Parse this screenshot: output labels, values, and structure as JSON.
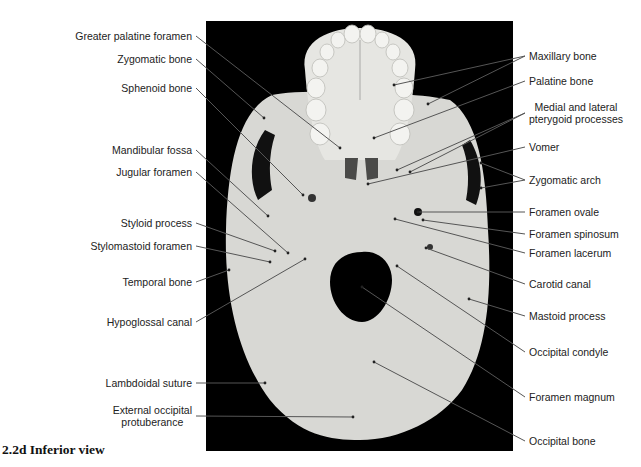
{
  "figure": {
    "caption": "2.2d Inferior view",
    "colors": {
      "background": "#000000",
      "bone": "#d9d9d6",
      "leader": "#555555",
      "label_text": "#222222"
    }
  },
  "labels_left": [
    {
      "id": "greater-palatine-foramen",
      "text": "Greater palatine foramen",
      "x": 196,
      "y": 36,
      "tx": 340,
      "ty": 148
    },
    {
      "id": "zygomatic-bone",
      "text": "Zygomatic bone",
      "x": 196,
      "y": 59,
      "tx": 264,
      "ty": 118
    },
    {
      "id": "sphenoid-bone",
      "text": "Sphenoid bone",
      "x": 196,
      "y": 88,
      "tx": 303,
      "ty": 195
    },
    {
      "id": "mandibular-fossa",
      "text": "Mandibular fossa",
      "x": 196,
      "y": 150,
      "tx": 268,
      "ty": 216
    },
    {
      "id": "jugular-foramen",
      "text": "Jugular foramen",
      "x": 196,
      "y": 172,
      "tx": 288,
      "ty": 253
    },
    {
      "id": "styloid-process",
      "text": "Styloid process",
      "x": 196,
      "y": 223,
      "tx": 275,
      "ty": 251
    },
    {
      "id": "stylomastoid-foramen",
      "text": "Stylomastoid foramen",
      "x": 196,
      "y": 246,
      "tx": 270,
      "ty": 262
    },
    {
      "id": "temporal-bone",
      "text": "Temporal bone",
      "x": 196,
      "y": 282,
      "tx": 229,
      "ty": 270
    },
    {
      "id": "hypoglossal-canal",
      "text": "Hypoglossal canal",
      "x": 196,
      "y": 322,
      "tx": 305,
      "ty": 259
    },
    {
      "id": "lambdoidal-suture",
      "text": "Lambdoidal suture",
      "x": 196,
      "y": 383,
      "tx": 265,
      "ty": 383
    },
    {
      "id": "external-occipital-protuberance",
      "text": "External occipital protuberance",
      "lines": [
        "External occipital",
        "protuberance"
      ],
      "x": 196,
      "y": 410,
      "tx": 353,
      "ty": 417
    }
  ],
  "labels_right": [
    {
      "id": "maxillary-bone",
      "text": "Maxillary bone",
      "x": 527,
      "y": 56,
      "tx": 394,
      "ty": 85,
      "tx2": 428,
      "ty2": 104
    },
    {
      "id": "palatine-bone",
      "text": "Palatine bone",
      "x": 527,
      "y": 81,
      "tx": 374,
      "ty": 138
    },
    {
      "id": "pterygoid-processes",
      "text": "Medial and lateral pterygoid processes",
      "lines": [
        "Medial and lateral",
        "pterygoid processes"
      ],
      "x": 527,
      "y": 107,
      "tx": 397,
      "ty": 170,
      "tx2": 410,
      "ty2": 172
    },
    {
      "id": "vomer",
      "text": "Vomer",
      "x": 527,
      "y": 147,
      "tx": 368,
      "ty": 184
    },
    {
      "id": "zygomatic-arch",
      "text": "Zygomatic arch",
      "x": 527,
      "y": 180,
      "tx": 481,
      "ty": 163,
      "tx2": 481,
      "ty2": 188
    },
    {
      "id": "foramen-ovale",
      "text": "Foramen ovale",
      "x": 527,
      "y": 212,
      "tx": 418,
      "ty": 212
    },
    {
      "id": "foramen-spinosum",
      "text": "Foramen spinosum",
      "x": 527,
      "y": 234,
      "tx": 423,
      "ty": 220
    },
    {
      "id": "foramen-lacerum",
      "text": "Foramen lacerum",
      "x": 527,
      "y": 253,
      "tx": 395,
      "ty": 219
    },
    {
      "id": "carotid-canal",
      "text": "Carotid canal",
      "x": 527,
      "y": 284,
      "tx": 426,
      "ty": 248
    },
    {
      "id": "mastoid-process",
      "text": "Mastoid process",
      "x": 527,
      "y": 316,
      "tx": 469,
      "ty": 299
    },
    {
      "id": "occipital-condyle",
      "text": "Occipital condyle",
      "x": 527,
      "y": 352,
      "tx": 397,
      "ty": 266
    },
    {
      "id": "foramen-magnum",
      "text": "Foramen magnum",
      "x": 527,
      "y": 397,
      "tx": 362,
      "ty": 287
    },
    {
      "id": "occipital-bone",
      "text": "Occipital bone",
      "x": 527,
      "y": 441,
      "tx": 374,
      "ty": 362
    }
  ]
}
